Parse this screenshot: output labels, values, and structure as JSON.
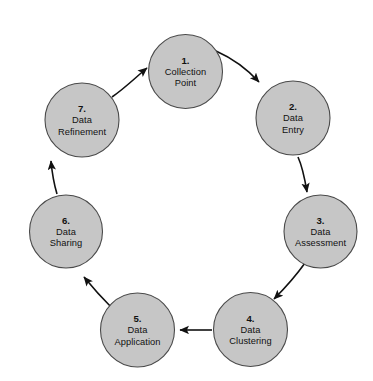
{
  "diagram": {
    "type": "cycle-diagram",
    "direction": "clockwise",
    "background_color": "#ffffff",
    "node_fill_color": "#c6c6c6",
    "node_stroke_color": "#4a4a4a",
    "arrow_color": "#111111",
    "nodes": [
      {
        "id": "node-1",
        "number": "1.",
        "line1": "Collection",
        "line2": "Point",
        "cx": 185.5,
        "cy": 71.5,
        "r": 37
      },
      {
        "id": "node-2",
        "number": "2.",
        "line1": "Data",
        "line2": "Entry",
        "cx": 293,
        "cy": 118,
        "r": 37
      },
      {
        "id": "node-3",
        "number": "3.",
        "line1": "Data",
        "line2": "Assessment",
        "cx": 320.5,
        "cy": 231.5,
        "r": 36.5
      },
      {
        "id": "node-4",
        "number": "4.",
        "line1": "Data",
        "line2": "Clustering",
        "cx": 250.5,
        "cy": 329.5,
        "r": 37
      },
      {
        "id": "node-5",
        "number": "5.",
        "line1": "Data",
        "line2": "Application",
        "cx": 137.5,
        "cy": 330,
        "r": 37
      },
      {
        "id": "node-6",
        "number": "6.",
        "line1": "Data",
        "line2": "Sharing",
        "cx": 66,
        "cy": 231.5,
        "r": 36.5
      },
      {
        "id": "node-7",
        "number": "7.",
        "line1": "Data",
        "line2": "Refinement",
        "cx": 82,
        "cy": 120,
        "r": 37
      }
    ],
    "arrows": [
      {
        "id": "arrow-1-to-2",
        "from": "node-1",
        "to": "node-2",
        "label": "Collection Point to Data Entry"
      },
      {
        "id": "arrow-2-to-3",
        "from": "node-2",
        "to": "node-3",
        "label": "Data Entry to Data Assessment"
      },
      {
        "id": "arrow-3-to-4",
        "from": "node-3",
        "to": "node-4",
        "label": "Data Assessment to Data Clustering"
      },
      {
        "id": "arrow-4-to-5",
        "from": "node-4",
        "to": "node-5",
        "label": "Data Clustering to Data Application"
      },
      {
        "id": "arrow-5-to-6",
        "from": "node-5",
        "to": "node-6",
        "label": "Data Application to Data Sharing"
      },
      {
        "id": "arrow-6-to-7",
        "from": "node-6",
        "to": "node-7",
        "label": "Data Sharing to Data Refinement"
      },
      {
        "id": "arrow-7-to-1",
        "from": "node-7",
        "to": "node-1",
        "label": "Data Refinement to Collection Point"
      }
    ]
  }
}
